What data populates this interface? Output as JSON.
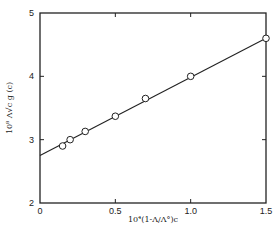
{
  "chart_data": {
    "type": "scatter",
    "title": "",
    "xlabel": "10⁴(1-Λ/Λ°)c",
    "ylabel": "10⁸ Λ√c g (c)",
    "xlim": [
      0,
      1.5
    ],
    "ylim": [
      2,
      5
    ],
    "x_ticks": [
      0,
      0.5,
      1.0,
      1.5
    ],
    "x_tick_labels": [
      "0",
      "0.5",
      "1.0",
      "1.5"
    ],
    "y_ticks": [
      2,
      3,
      4,
      5
    ],
    "y_tick_labels": [
      "2",
      "3",
      "4",
      "5"
    ],
    "grid": false,
    "legend": null,
    "series": [
      {
        "name": "measured",
        "marker": "open-circle",
        "x": [
          0.15,
          0.2,
          0.3,
          0.5,
          0.7,
          1.0,
          1.5
        ],
        "y": [
          2.9,
          3.0,
          3.13,
          3.37,
          3.65,
          4.0,
          4.6
        ]
      },
      {
        "name": "linear fit",
        "style": "line",
        "x": [
          0,
          1.5
        ],
        "y": [
          2.75,
          4.6
        ]
      }
    ]
  }
}
